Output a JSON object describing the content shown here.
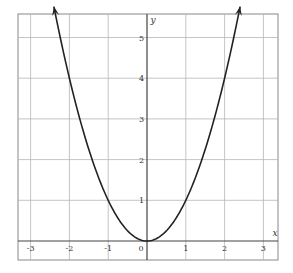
{
  "chart_data": {
    "type": "line",
    "title": "",
    "function": "y = x^2",
    "xlabel": "x",
    "ylabel": "y",
    "xlim": [
      -3.4,
      3.4
    ],
    "ylim": [
      -0.45,
      5.6
    ],
    "x_ticks": [
      -3,
      -2,
      -1,
      0,
      1,
      2,
      3
    ],
    "x_tick_labels": [
      "-3",
      "-2",
      "-1",
      "0",
      "1",
      "2",
      "3"
    ],
    "y_ticks": [
      1,
      2,
      3,
      4,
      5
    ],
    "y_tick_labels": [
      "1",
      "2",
      "3",
      "4",
      "5"
    ],
    "grid": true,
    "legend": null,
    "series": [
      {
        "name": "y = x^2",
        "x": [
          -2.4,
          -2,
          -1.5,
          -1,
          -0.5,
          0,
          0.5,
          1,
          1.5,
          2,
          2.4
        ],
        "y": [
          5.76,
          4,
          2.25,
          1,
          0.25,
          0,
          0.25,
          1,
          2.25,
          4,
          5.76
        ],
        "arrows_at_ends": true
      }
    ],
    "annotations": []
  },
  "colors": {
    "grid": "#b5b5b5",
    "axis": "#444444",
    "curve": "#222222",
    "frame": "#888888"
  }
}
